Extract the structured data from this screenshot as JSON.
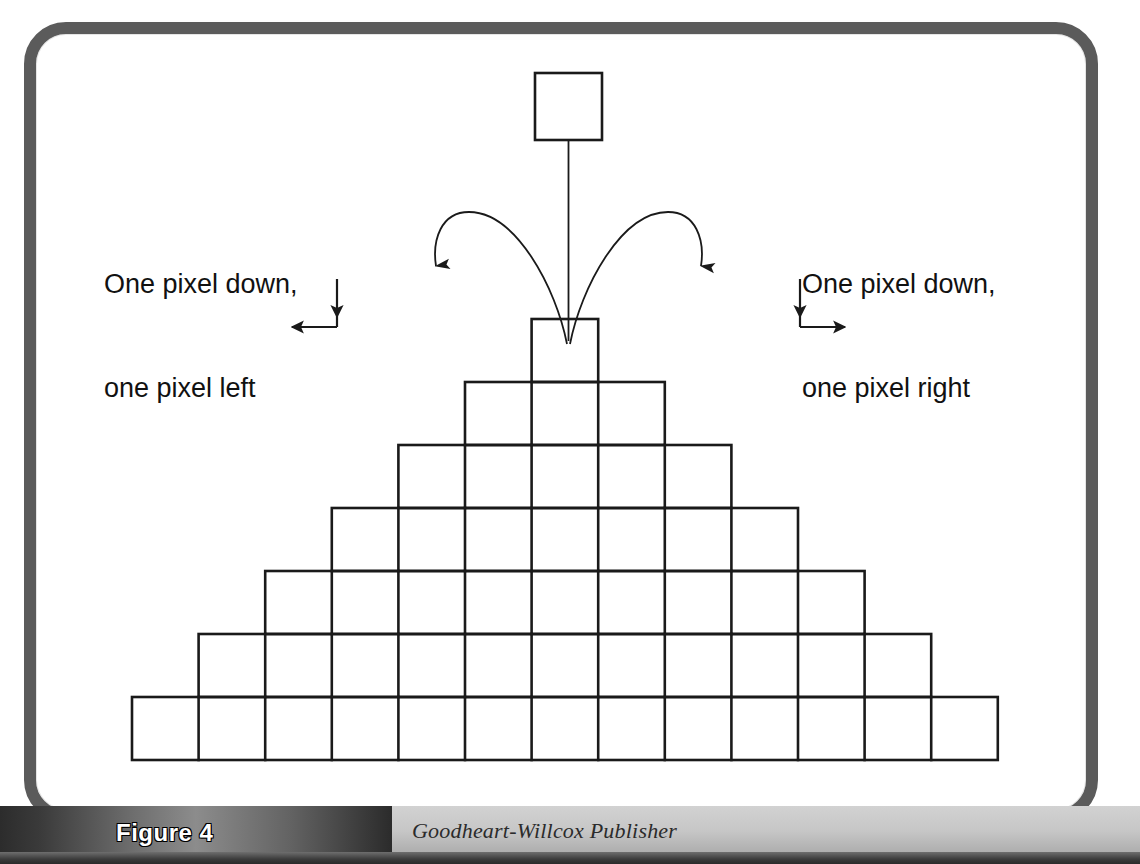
{
  "figure": {
    "label": "Figure 4",
    "credit": "Goodheart-Willcox Publisher",
    "frame_border_color": "#5b5b5b",
    "background_color": "#ffffff",
    "line_color": "#1a1a1a"
  },
  "callouts": {
    "left": {
      "line1": "One pixel down,",
      "line2": "one pixel left"
    },
    "right": {
      "line1": "One pixel down,",
      "line2": "one pixel right"
    }
  },
  "diagram": {
    "top_node": {
      "x": 535,
      "y": 73,
      "size": 67
    },
    "stem": {
      "x": 568,
      "y_from": 140,
      "y_to": 340
    },
    "arc_left": {
      "label": "branch-left-arc",
      "from_x": 568,
      "from_y": 345,
      "to_x": 437,
      "to_y": 273
    },
    "arc_right": {
      "label": "branch-right-arc",
      "from_x": 568,
      "from_y": 345,
      "to_x": 700,
      "to_y": 273
    },
    "direction_marker_left": {
      "label": "down-then-left",
      "corner_x": 337,
      "corner_y": 327
    },
    "direction_marker_right": {
      "label": "down-then-right",
      "corner_x": 800,
      "corner_y": 327
    },
    "grid": {
      "cell_width": 66.6,
      "cell_height": 63,
      "left": 132,
      "bottom": 760,
      "rows": [
        {
          "row": 1,
          "cells": 1
        },
        {
          "row": 2,
          "cells": 3
        },
        {
          "row": 3,
          "cells": 5
        },
        {
          "row": 4,
          "cells": 7
        },
        {
          "row": 5,
          "cells": 9
        },
        {
          "row": 6,
          "cells": 11
        },
        {
          "row": 7,
          "cells": 13
        }
      ]
    }
  }
}
